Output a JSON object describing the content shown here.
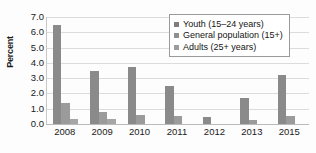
{
  "chart_data": {
    "type": "bar",
    "title": "",
    "xlabel": "",
    "ylabel": "Percent",
    "ylim": [
      0.0,
      7.0
    ],
    "ytick_step": 1.0,
    "ytick_labels": [
      "7.0",
      "6.0",
      "5.0",
      "4.0",
      "3.0",
      "2.0",
      "1.0",
      "0.0"
    ],
    "ytick_values": [
      7.0,
      6.0,
      5.0,
      4.0,
      3.0,
      2.0,
      1.0,
      0.0
    ],
    "grid": true,
    "grid_axis": "y",
    "legend_position": "top-right",
    "categories": [
      "2008",
      "2009",
      "2010",
      "2011",
      "2012",
      "2013",
      "2015"
    ],
    "series": [
      {
        "name": "Youth (15–24 years)",
        "color": "#8a8a8a",
        "values": [
          6.45,
          3.5,
          3.7,
          2.5,
          0.45,
          1.7,
          3.2
        ]
      },
      {
        "name": "General population (15+)",
        "color": "#9b9b9b",
        "values": [
          1.35,
          0.8,
          0.6,
          0.55,
          0.0,
          0.25,
          0.5
        ]
      },
      {
        "name": "Adults (25+ years)",
        "color": "#a6a6a6",
        "values": [
          0.35,
          0.3,
          0.0,
          0.0,
          0.0,
          0.0,
          0.0
        ]
      }
    ]
  },
  "legend": {
    "items": [
      {
        "label": "Youth (15–24 years)",
        "swatch": "#7e7e7e"
      },
      {
        "label": "General population (15+)",
        "swatch": "#8f8f8f"
      },
      {
        "label": "Adults (25+ years)",
        "swatch": "#9c9c9c"
      }
    ]
  },
  "axes": {
    "y_title": "Percent"
  },
  "colors": {
    "background": "#fdfdfd",
    "gridline": "#dcdcdc",
    "axis": "#b9b9b9",
    "text": "#1a1a1a",
    "legend_border": "#9a9a9a"
  }
}
